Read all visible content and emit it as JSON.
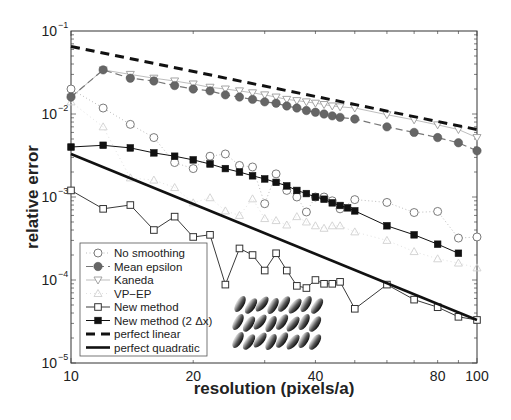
{
  "chart_data": {
    "type": "line",
    "title": "",
    "xlabel": "resolution (pixels/a)",
    "ylabel": "relative error",
    "xscale": "log",
    "yscale": "log",
    "xlim": [
      10,
      100
    ],
    "ylim": [
      1e-05,
      0.1
    ],
    "xticks": [
      10,
      20,
      40,
      80,
      100
    ],
    "xtick_labels": [
      "10",
      "20",
      "40",
      "80",
      "100"
    ],
    "yticks": [
      1e-05,
      0.0001,
      0.001,
      0.01,
      0.1
    ],
    "ytick_labels": [
      {
        "base": "10",
        "exp": "−5"
      },
      {
        "base": "10",
        "exp": "−4"
      },
      {
        "base": "10",
        "exp": "−3"
      },
      {
        "base": "10",
        "exp": "−2"
      },
      {
        "base": "10",
        "exp": "−1"
      }
    ],
    "grid": false,
    "legend_position": "lower left",
    "inset_image": "grid of tilted elliptical particles (3 rows)",
    "series": [
      {
        "name": "No smoothing",
        "marker": "open-circle",
        "line": "dotted",
        "color": "#8a8a8a",
        "x": [
          10,
          12,
          14,
          16,
          18,
          20,
          22,
          24,
          26,
          28,
          30,
          32,
          34,
          36,
          38,
          40,
          42,
          44,
          46,
          50,
          60,
          70,
          80,
          90,
          100
        ],
        "y": [
          0.02,
          0.0118,
          0.0075,
          0.0052,
          0.0026,
          0.0022,
          0.0031,
          0.0033,
          0.0024,
          0.0023,
          0.00083,
          0.0019,
          0.0012,
          0.001,
          0.00066,
          0.001,
          0.001,
          0.0009,
          0.00072,
          0.00093,
          0.00086,
          0.00065,
          0.00067,
          0.00032,
          0.00033
        ]
      },
      {
        "name": "Mean epsilon",
        "marker": "filled-circle",
        "line": "dashed",
        "color": "#6a6a6a",
        "x": [
          10,
          12,
          14,
          16,
          18,
          20,
          22,
          24,
          26,
          28,
          30,
          32,
          34,
          36,
          38,
          40,
          42,
          44,
          46,
          50,
          60,
          70,
          80,
          90,
          100
        ],
        "y": [
          0.016,
          0.034,
          0.027,
          0.025,
          0.022,
          0.02,
          0.019,
          0.017,
          0.016,
          0.015,
          0.014,
          0.0135,
          0.0125,
          0.0118,
          0.011,
          0.0105,
          0.01,
          0.0095,
          0.0091,
          0.0087,
          0.007,
          0.006,
          0.0052,
          0.0045,
          0.0036
        ]
      },
      {
        "name": "Kaneda",
        "marker": "open-triangle-down",
        "line": "solid-thin",
        "color": "#a0a0a0",
        "x": [
          10,
          12,
          14,
          16,
          18,
          20,
          22,
          24,
          26,
          28,
          30,
          32,
          34,
          36,
          38,
          40,
          42,
          44,
          46,
          50,
          60,
          70,
          80,
          90,
          100
        ],
        "y": [
          0.016,
          0.034,
          0.03,
          0.027,
          0.025,
          0.023,
          0.021,
          0.02,
          0.019,
          0.018,
          0.017,
          0.016,
          0.015,
          0.0145,
          0.014,
          0.0135,
          0.013,
          0.0125,
          0.0122,
          0.0118,
          0.0098,
          0.0085,
          0.0074,
          0.0065,
          0.0052
        ]
      },
      {
        "name": "VP−EP",
        "marker": "open-triangle-up",
        "line": "dotted-faint",
        "color": "#cfcfcf",
        "x": [
          10,
          12,
          14,
          16,
          18,
          20,
          22,
          24,
          26,
          28,
          30,
          32,
          34,
          36,
          38,
          40,
          42,
          44,
          46,
          50,
          60,
          70,
          80,
          90,
          100
        ],
        "y": [
          0.014,
          0.007,
          0.0017,
          0.0016,
          0.0013,
          0.00085,
          0.00098,
          0.00068,
          0.0006,
          0.00095,
          0.00055,
          0.00052,
          0.00046,
          0.00058,
          0.0005,
          0.00045,
          0.00042,
          0.00045,
          0.00045,
          0.00038,
          0.0003,
          0.00022,
          0.00018,
          0.00016,
          0.00014
        ]
      },
      {
        "name": "New method",
        "marker": "open-square",
        "line": "solid",
        "color": "#3a3a3a",
        "x": [
          10,
          12,
          14,
          16,
          18,
          20,
          22,
          24,
          26,
          28,
          30,
          32,
          34,
          36,
          38,
          40,
          42,
          44,
          46,
          50,
          60,
          70,
          80,
          90,
          100
        ],
        "y": [
          0.0012,
          0.00072,
          0.0008,
          0.0004,
          0.00058,
          0.00033,
          0.00035,
          8.8e-05,
          0.00024,
          0.0002,
          0.00013,
          0.00021,
          0.00013,
          8.5e-05,
          8e-05,
          0.0001,
          9e-05,
          9e-05,
          9.5e-05,
          4.5e-05,
          8.8e-05,
          5.8e-05,
          4.7e-05,
          3.6e-05,
          3.3e-05
        ]
      },
      {
        "name": "New method (2 Δx)",
        "marker": "filled-square",
        "line": "solid",
        "color": "#111111",
        "x": [
          10,
          12,
          14,
          16,
          18,
          20,
          22,
          24,
          26,
          28,
          30,
          32,
          34,
          36,
          38,
          40,
          42,
          44,
          46,
          48,
          50,
          60,
          70,
          80,
          90
        ],
        "y": [
          0.004,
          0.0042,
          0.0039,
          0.0034,
          0.0031,
          0.0028,
          0.0025,
          0.0022,
          0.002,
          0.0018,
          0.00165,
          0.0015,
          0.00136,
          0.0012,
          0.0011,
          0.001,
          0.00094,
          0.00085,
          0.00079,
          0.00074,
          0.00068,
          0.00045,
          0.00035,
          0.00027,
          0.00021
        ]
      },
      {
        "name": "perfect linear",
        "marker": "none",
        "line": "dashed-thick",
        "color": "#111111",
        "x": [
          10,
          100
        ],
        "y": [
          0.065,
          0.0065
        ]
      },
      {
        "name": "perfect quadratic",
        "marker": "none",
        "line": "solid-thick",
        "color": "#111111",
        "x": [
          10,
          100
        ],
        "y": [
          0.0033,
          3.3e-05
        ]
      }
    ]
  },
  "legend": {
    "items": [
      {
        "label": "No smoothing"
      },
      {
        "label": "Mean epsilon"
      },
      {
        "label": "Kaneda"
      },
      {
        "label": "VP−EP"
      },
      {
        "label": "New method"
      },
      {
        "label": "New method (2 Δx)"
      },
      {
        "label": "perfect linear"
      },
      {
        "label": "perfect quadratic"
      }
    ]
  },
  "axes": {
    "xlabel": "resolution (pixels/a)",
    "ylabel": "relative error"
  }
}
